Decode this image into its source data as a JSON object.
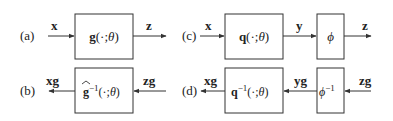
{
  "panels": {
    "a": {
      "label": "(a)",
      "input": "x",
      "block": {
        "fn": "g",
        "args": "(·;",
        "param": "θ",
        "close": ")"
      },
      "output": "z"
    },
    "b": {
      "label": "(b)",
      "input": "zg",
      "block": {
        "hat": "^",
        "fn": "g",
        "sup": "−1",
        "args": "(·;",
        "param": "θ",
        "close": ")"
      },
      "output": "xg"
    },
    "c": {
      "label": "(c)",
      "input": "x",
      "block1": {
        "fn": "q",
        "args": "(·;",
        "param": "θ",
        "close": ")"
      },
      "mid": "y",
      "block2": {
        "fn": "ϕ"
      },
      "output": "z"
    },
    "d": {
      "label": "(d)",
      "input": "zg",
      "block2": {
        "fn": "ϕ",
        "sup": "−1"
      },
      "mid": "yg",
      "block1": {
        "fn": "q",
        "sup": "−1",
        "args": "(·;",
        "param": "θ",
        "close": ")"
      },
      "output": "xg"
    }
  },
  "colors": {
    "stroke": "#333333",
    "text": "#222222",
    "background": "#ffffff"
  }
}
